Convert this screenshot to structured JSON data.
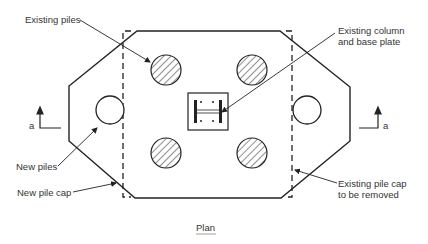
{
  "drawing": {
    "title": "Plan",
    "labels": {
      "existing_piles": "Existing piles",
      "existing_column_line1": "Existing column",
      "existing_column_line2": "and base plate",
      "new_piles": "New piles",
      "new_pile_cap": "New pile cap",
      "existing_pile_cap_line1": "Existing pile cap",
      "existing_pile_cap_line2": "to be removed",
      "section_left": "a",
      "section_right": "a"
    },
    "colors": {
      "line": "#222222",
      "text": "#333333",
      "background": "#ffffff"
    }
  }
}
